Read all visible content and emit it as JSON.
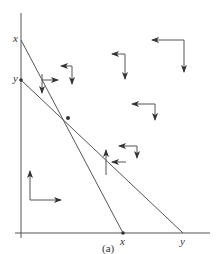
{
  "figure": {
    "caption": "(a)",
    "colors": {
      "line": "#555555",
      "arrow": "#333333",
      "text": "#333333",
      "background": "#ffffff"
    },
    "axes": {
      "vertical": {
        "x": 21,
        "y_top": 13,
        "y_bottom": 238
      },
      "horizontal": {
        "y": 233,
        "x_left": 15,
        "x_right": 210
      }
    },
    "labels": {
      "y_axis_x": "x",
      "y_axis_y": "y",
      "x_axis_x": "x",
      "x_axis_y": "y"
    },
    "lines": [
      {
        "name": "steep-line",
        "from": [
          21,
          40
        ],
        "to": [
          123,
          233
        ]
      },
      {
        "name": "shallow-line",
        "from": [
          21,
          80
        ],
        "to": [
          183,
          233
        ]
      }
    ],
    "points": [
      {
        "name": "y-axis-point-y",
        "at": [
          21,
          80
        ]
      },
      {
        "name": "intersection-point",
        "at": [
          68,
          118
        ]
      },
      {
        "name": "x-axis-point-x",
        "at": [
          123,
          233
        ]
      }
    ],
    "arrow_pairs": [
      {
        "name": "arrow-pair-near-top-steep",
        "corner": [
          42,
          80
        ],
        "h_to": [
          58,
          80
        ],
        "v_from": [
          42,
          76
        ],
        "v_to": [
          42,
          93
        ],
        "h_dir": "right",
        "v_dir": "down"
      },
      {
        "name": "arrow-pair-upper-mid",
        "corner": [
          72,
          66
        ],
        "h_to": [
          61,
          66
        ],
        "v_to": [
          72,
          83
        ],
        "h_dir": "left",
        "v_dir": "down"
      },
      {
        "name": "arrow-pair-top-right-small",
        "corner": [
          125,
          53
        ],
        "h_to": [
          112,
          53
        ],
        "v_to": [
          125,
          78
        ],
        "h_dir": "left",
        "v_dir": "down"
      },
      {
        "name": "arrow-pair-top-right-large",
        "corner": [
          184,
          40
        ],
        "h_to": [
          152,
          40
        ],
        "v_to": [
          184,
          70
        ],
        "h_dir": "left",
        "v_dir": "down"
      },
      {
        "name": "arrow-pair-right-mid",
        "corner": [
          155,
          104
        ],
        "h_to": [
          132,
          104
        ],
        "v_to": [
          155,
          118
        ],
        "h_dir": "left",
        "v_dir": "down"
      },
      {
        "name": "arrow-pair-lower-shallow",
        "corner": [
          137,
          147
        ],
        "h_to": [
          119,
          147
        ],
        "v_to": [
          137,
          158
        ],
        "h_dir": "left",
        "v_dir": "down"
      },
      {
        "name": "arrow-pair-lower-steep",
        "corner": [
          106,
          164
        ],
        "h_to": [
          118,
          164
        ],
        "v_to": [
          106,
          148
        ],
        "h_dir": "left-from-line",
        "v_dir": "up"
      },
      {
        "name": "arrow-pair-origin",
        "corner": [
          30,
          200
        ],
        "h_to": [
          60,
          200
        ],
        "v_to": [
          30,
          172
        ],
        "h_dir": "right",
        "v_dir": "up"
      }
    ]
  }
}
